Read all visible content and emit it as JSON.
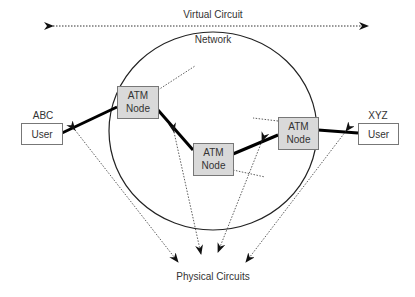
{
  "title": "Virtual Circuit",
  "network_label": "Network",
  "physical_label": "Physical Circuits",
  "nodes": [
    {
      "line1": "ATM",
      "line2": "Node"
    },
    {
      "line1": "ATM",
      "line2": "Node"
    },
    {
      "line1": "ATM",
      "line2": "Node"
    }
  ],
  "users": [
    {
      "name": "ABC",
      "label": "User"
    },
    {
      "name": "XYZ",
      "label": "User"
    }
  ],
  "colors": {
    "node_fill": "#d9d9d9",
    "line": "#000000"
  }
}
